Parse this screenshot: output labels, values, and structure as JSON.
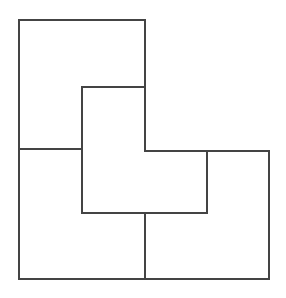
{
  "diagram": {
    "stroke_color": "#444444",
    "stroke_width": 2,
    "background": "#ffffff",
    "outer_outline": [
      [
        19,
        20
      ],
      [
        145,
        20
      ],
      [
        145,
        151
      ],
      [
        269,
        151
      ],
      [
        269,
        279
      ],
      [
        19,
        279
      ]
    ],
    "segments": [
      {
        "name": "left-divider",
        "points": [
          [
            19,
            149
          ],
          [
            82,
            149
          ]
        ]
      },
      {
        "name": "inner-top",
        "points": [
          [
            82,
            87
          ],
          [
            145,
            87
          ]
        ]
      },
      {
        "name": "inner-left",
        "points": [
          [
            82,
            87
          ],
          [
            82,
            213
          ]
        ]
      },
      {
        "name": "inner-bottom",
        "points": [
          [
            82,
            213
          ],
          [
            207,
            213
          ]
        ]
      },
      {
        "name": "inner-right",
        "points": [
          [
            207,
            151
          ],
          [
            207,
            213
          ]
        ]
      },
      {
        "name": "bottom-divider",
        "points": [
          [
            145,
            213
          ],
          [
            145,
            279
          ]
        ]
      }
    ]
  }
}
